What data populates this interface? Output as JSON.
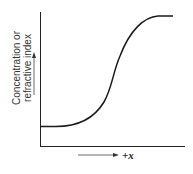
{
  "diagram": {
    "y_label_line1": "Concentration or",
    "y_label_line2": "refractive index",
    "x_label": "+x",
    "curve": "sigmoid",
    "curve_color": "#1a1a1a",
    "axis_color": "#222222"
  }
}
